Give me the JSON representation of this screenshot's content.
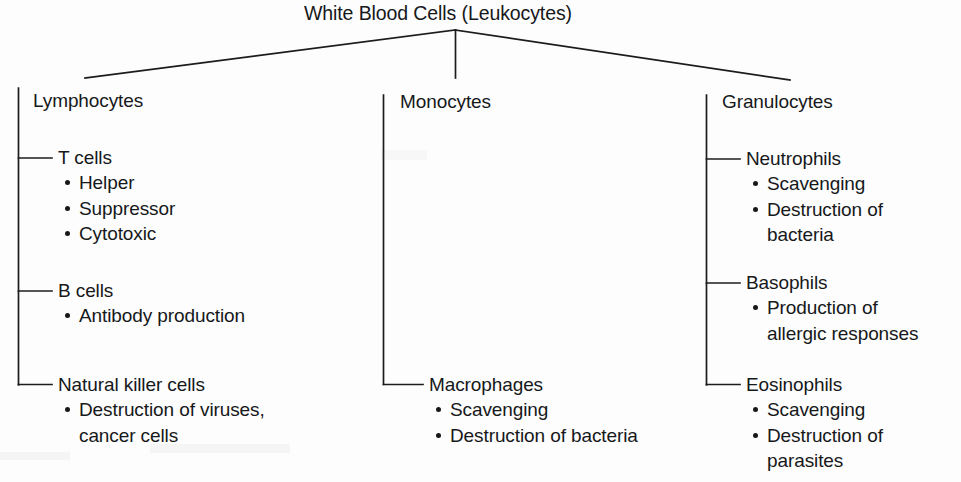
{
  "diagram": {
    "title": "White Blood Cells (Leukocytes)",
    "type": "hierarchy-tree",
    "branches": [
      {
        "name": "lymphocytes",
        "label": "Lymphocytes",
        "children": [
          {
            "name": "t-cells",
            "label": "T cells",
            "bullets": [
              "Helper",
              "Suppressor",
              "Cytotoxic"
            ]
          },
          {
            "name": "b-cells",
            "label": "B cells",
            "bullets": [
              "Antibody production"
            ]
          },
          {
            "name": "natural-killer-cells",
            "label": "Natural killer cells",
            "bullets": [
              "Destruction of viruses,",
              "cancer cells"
            ]
          }
        ]
      },
      {
        "name": "monocytes",
        "label": "Monocytes",
        "children": [
          {
            "name": "macrophages",
            "label": "Macrophages",
            "bullets": [
              "Scavenging",
              "Destruction of bacteria"
            ]
          }
        ]
      },
      {
        "name": "granulocytes",
        "label": "Granulocytes",
        "children": [
          {
            "name": "neutrophils",
            "label": "Neutrophils",
            "bullets": [
              "Scavenging",
              "Destruction of",
              "bacteria"
            ]
          },
          {
            "name": "basophils",
            "label": "Basophils",
            "bullets": [
              "Production of",
              "allergic responses"
            ]
          },
          {
            "name": "eosinophils",
            "label": "Eosinophils",
            "bullets": [
              "Scavenging",
              "Destruction of",
              "parasites"
            ]
          }
        ]
      }
    ],
    "colors": {
      "ink": "#16181a",
      "line": "#1a1c1e",
      "background": "#fdfdfd"
    }
  }
}
